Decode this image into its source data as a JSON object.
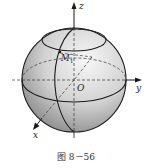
{
  "figure": {
    "caption": "图 8－56",
    "axes": {
      "z_label": "z",
      "y_label": "y",
      "x_label": "x",
      "origin_label": "O"
    },
    "point_label": "M",
    "point_subscript": "1",
    "colors": {
      "sphere_light": "#f4f4f4",
      "sphere_dark": "#8a8a8a",
      "line": "#1a1a1a"
    }
  }
}
